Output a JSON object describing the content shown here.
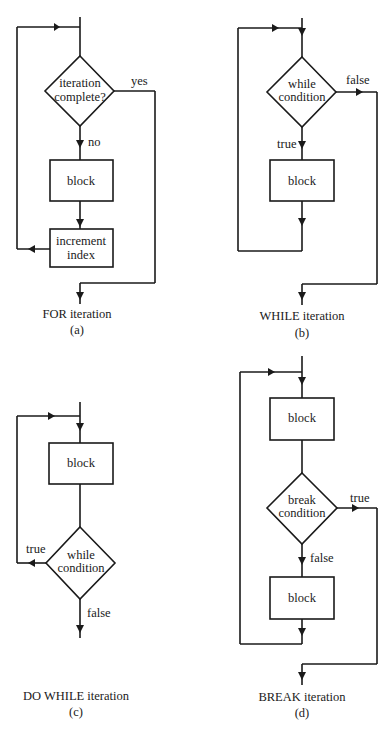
{
  "figure": {
    "panels": [
      {
        "id": "a",
        "caption": "FOR iteration",
        "sub": "(a)",
        "decision": [
          "iteration",
          "complete?"
        ],
        "block": "block",
        "increment": [
          "increment",
          "index"
        ],
        "label_no": "no",
        "label_yes": "yes"
      },
      {
        "id": "b",
        "caption": "WHILE iteration",
        "sub": "(b)",
        "decision": [
          "while",
          "condition"
        ],
        "block": "block",
        "label_true": "true",
        "label_false": "false"
      },
      {
        "id": "c",
        "caption": "DO WHILE iteration",
        "sub": "(c)",
        "decision": [
          "while",
          "condition"
        ],
        "block": "block",
        "label_true": "true",
        "label_false": "false"
      },
      {
        "id": "d",
        "caption": "BREAK iteration",
        "sub": "(d)",
        "decision": [
          "break",
          "condition"
        ],
        "block1": "block",
        "block2": "block",
        "label_true": "true",
        "label_false": "false"
      }
    ]
  }
}
